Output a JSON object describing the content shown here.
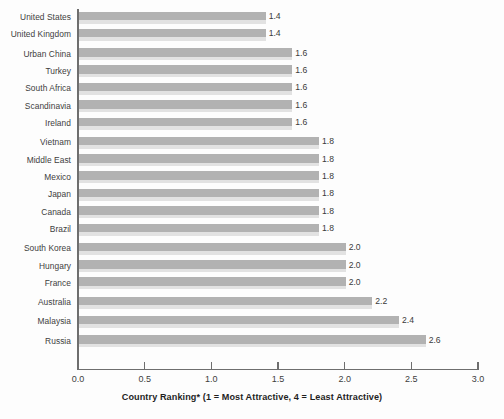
{
  "chart_data": {
    "type": "bar",
    "orientation": "horizontal",
    "title": "",
    "subtitle": "",
    "xlabel": "Country Ranking* (1 = Most Attractive, 4 = Least Attractive)",
    "ylabel": "",
    "xlim": [
      0.0,
      3.0
    ],
    "grid": false,
    "legend": null,
    "xticks": [
      "0.0",
      "0.5",
      "1.0",
      "1.5",
      "2.0",
      "2.5",
      "3.0"
    ],
    "xtick_values": [
      0.0,
      0.5,
      1.0,
      1.5,
      2.0,
      2.5,
      3.0
    ],
    "categories": [
      "United States",
      "United Kingdom",
      "Urban China",
      "Turkey",
      "South Africa",
      "Scandinavia",
      "Ireland",
      "Vietnam",
      "Middle East",
      "Mexico",
      "Japan",
      "Canada",
      "Brazil",
      "South Korea",
      "Hungary",
      "France",
      "Australia",
      "Malaysia",
      "Russia"
    ],
    "values": [
      1.4,
      1.4,
      1.6,
      1.6,
      1.6,
      1.6,
      1.6,
      1.8,
      1.8,
      1.8,
      1.8,
      1.8,
      1.8,
      2.0,
      2.0,
      2.0,
      2.2,
      2.4,
      2.6
    ],
    "value_labels": [
      "1.4",
      "1.4",
      "1.6",
      "1.6",
      "1.6",
      "1.6",
      "1.6",
      "1.8",
      "1.8",
      "1.8",
      "1.8",
      "1.8",
      "1.8",
      "2.0",
      "2.0",
      "2.0",
      "2.2",
      "2.4",
      "2.6"
    ],
    "bar_color": "#b2b2b2",
    "bar_shadow_color": "#e2e2e2",
    "axis_color": "#6e6e6e",
    "text_color": "#3d3d3d",
    "background_color": "#fdfdfd"
  }
}
